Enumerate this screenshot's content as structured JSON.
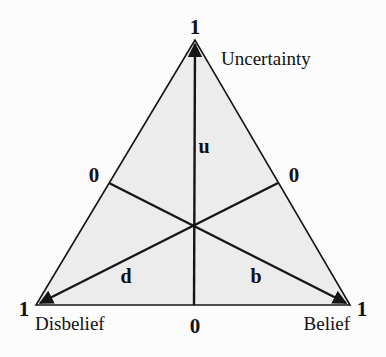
{
  "diagram": {
    "colors": {
      "background": "#fcfcfc",
      "triangle_fill": "#ececec",
      "stroke": "#151515"
    },
    "vertices": {
      "top": {
        "label": "Uncertainty",
        "value": "1"
      },
      "left": {
        "label": "Disbelief",
        "value": "1"
      },
      "right": {
        "label": "Belief",
        "value": "1"
      }
    },
    "side_values": {
      "left": "0",
      "right": "0",
      "bottom": "0"
    },
    "axes": {
      "u": "u",
      "d": "d",
      "b": "b"
    }
  }
}
